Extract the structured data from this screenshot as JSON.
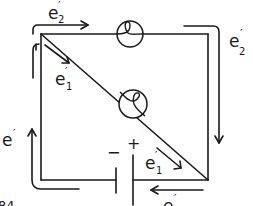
{
  "figure": {
    "number_label": "84"
  },
  "colors": {
    "ink": "#1a1a1a",
    "background": "#ffffff"
  },
  "battery": {
    "plus_sign": "+",
    "minus_sign": "−"
  },
  "bulbs": [
    {
      "id": "bulb-2",
      "position": "top wire"
    },
    {
      "id": "bulb-1",
      "position": "diagonal branch"
    }
  ],
  "labels": {
    "top_flow": {
      "base": "e",
      "prime": "′",
      "sub": "2"
    },
    "right_flow": {
      "base": "e",
      "prime": "′",
      "sub": "2"
    },
    "diagonal_upper": {
      "base": "e",
      "prime": "′",
      "sub": "1"
    },
    "diagonal_lower": {
      "base": "e",
      "prime": "′",
      "sub": "1"
    },
    "left_flow": {
      "base": "e",
      "prime": "′"
    },
    "bottom_flow": {
      "base": "e",
      "prime": "′"
    }
  }
}
